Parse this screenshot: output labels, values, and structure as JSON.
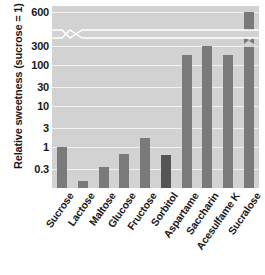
{
  "chart_data": {
    "type": "bar",
    "title": "",
    "xlabel": "",
    "ylabel": "Relative sweetness (sucrose = 1)",
    "yscale": "log",
    "ylim": [
      0.1,
      600
    ],
    "grid": true,
    "legend": "none",
    "axis_break": {
      "between": [
        300,
        600
      ],
      "note": "zigzag break on y-axis between 300 and 600"
    },
    "ytick_labels": [
      "600",
      "300",
      "100",
      "30",
      "10",
      "3",
      "1",
      "0.3"
    ],
    "ytick_values": [
      600,
      300,
      100,
      30,
      10,
      3,
      1,
      0.3
    ],
    "categories": [
      "Sucrose",
      "Lactose",
      "Maltose",
      "Glucose",
      "Fructose",
      "Sorbitol",
      "Aspartame",
      "Saccharin",
      "Acesulfame K",
      "Sucralose"
    ],
    "values": [
      1.0,
      0.15,
      0.33,
      0.7,
      1.7,
      0.65,
      180,
      300,
      180,
      600
    ],
    "bar_colors": [
      "#7a7a7a",
      "#7a7a7a",
      "#7a7a7a",
      "#7a7a7a",
      "#7a7a7a",
      "#555555",
      "#7a7a7a",
      "#7a7a7a",
      "#7a7a7a",
      "#7a7a7a"
    ],
    "bars_with_break": [
      "Sucralose"
    ],
    "colors": {
      "panel_background": "#d2d2d2",
      "gridline": "#f2f2f2",
      "bar_default": "#7a7a7a",
      "bar_highlight": "#555555",
      "text": "#1a1a1a",
      "figure_background": "#ffffff"
    }
  }
}
